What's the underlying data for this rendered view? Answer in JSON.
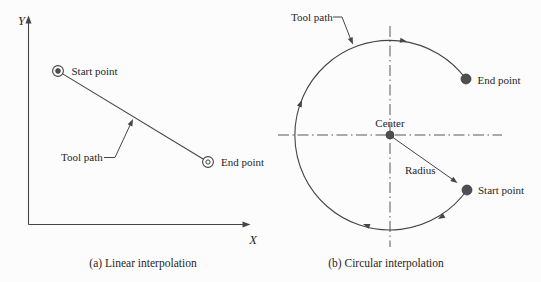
{
  "colors": {
    "background": "#fcfcfc",
    "line": "#454545",
    "text": "#262626",
    "point_fill": "#4f4f4f"
  },
  "panel_a": {
    "caption": "(a) Linear interpolation",
    "y_axis_label": "Y",
    "x_axis_label": "X",
    "start_point_label": "Start point",
    "end_point_label": "End point",
    "tool_path_label": "Tool path"
  },
  "panel_b": {
    "caption": "(b) Circular interpolation",
    "tool_path_label": "Tool path",
    "center_label": "Center",
    "radius_label": "Radius",
    "end_point_label": "End point",
    "start_point_label": "Start point"
  }
}
